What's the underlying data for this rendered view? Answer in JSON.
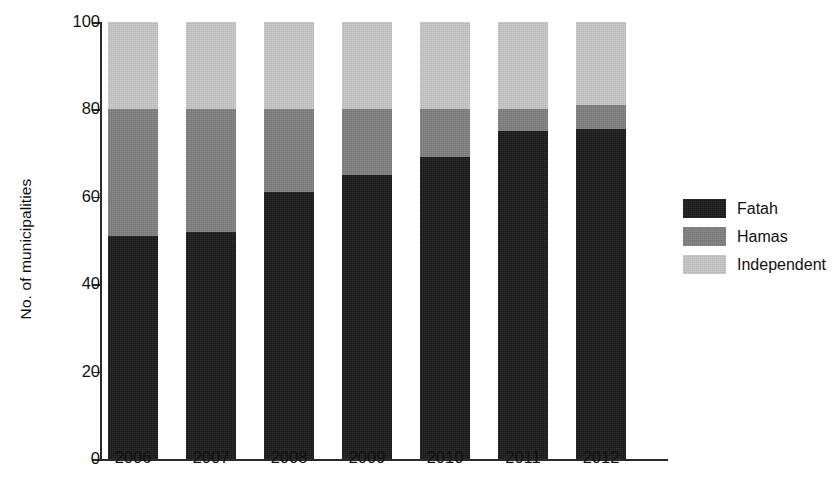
{
  "chart_data": {
    "type": "bar",
    "stacked": true,
    "title": "",
    "subtitle": "",
    "xlabel": "",
    "ylabel": "No. of municipalities",
    "categories": [
      "2006",
      "2007",
      "2008",
      "2009",
      "2010",
      "2011",
      "2012"
    ],
    "series": [
      {
        "name": "Fatah",
        "color": "#1a1a1a",
        "values": [
          51,
          52,
          61,
          65,
          69,
          75,
          75.5
        ]
      },
      {
        "name": "Hamas",
        "color": "#808080",
        "values": [
          29,
          28,
          19,
          15,
          11,
          5,
          5.5
        ]
      },
      {
        "name": "Independent",
        "color": "#c8c8c8",
        "values": [
          20,
          20,
          20,
          20,
          20,
          20,
          19
        ]
      }
    ],
    "cumulative_tops": {
      "fatah": [
        51,
        52,
        61,
        65,
        69,
        75,
        75.5
      ],
      "fatah_plus_hamas": [
        80,
        80,
        80,
        80,
        80,
        80,
        81
      ],
      "total": [
        100,
        100,
        100,
        100,
        100,
        100,
        100
      ]
    },
    "ylim": [
      0,
      100
    ],
    "yticks": [
      0,
      20,
      40,
      60,
      80,
      100
    ],
    "ytick_labels": [
      "0",
      "20",
      "40",
      "60",
      "80",
      "100"
    ],
    "grid": false,
    "legend_position": "right",
    "legend_entries": [
      "Fatah",
      "Hamas",
      "Independent"
    ]
  },
  "legend": {
    "items": [
      {
        "label": "Fatah",
        "color": "#1a1a1a"
      },
      {
        "label": "Hamas",
        "color": "#808080"
      },
      {
        "label": "Independent",
        "color": "#c8c8c8"
      }
    ]
  },
  "axes": {
    "y_title": "No. of municipalities",
    "y_labels": [
      "100",
      "80",
      "60",
      "40",
      "20",
      "0"
    ],
    "x_labels": [
      "2006",
      "2007",
      "2008",
      "2009",
      "2010",
      "2011",
      "2012"
    ]
  }
}
